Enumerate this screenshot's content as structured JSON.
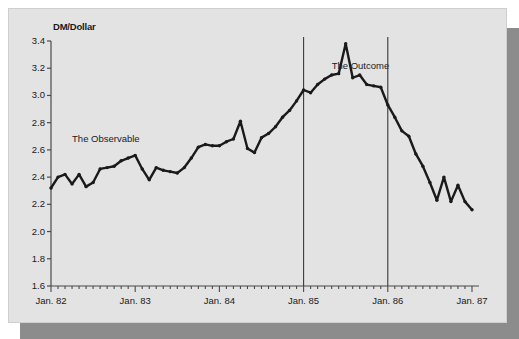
{
  "figure": {
    "background_color": "#e3e3e3",
    "shadow_color": "#8c8c8c",
    "line_color": "#1a1a1a",
    "axis_color": "#4a4a4a"
  },
  "chart_data": {
    "type": "line",
    "title": "",
    "ylabel": "DM/Dollar",
    "xlabel": "",
    "ylim": [
      1.6,
      3.4
    ],
    "yticks": [
      "3.4",
      "3.2",
      "3.0",
      "2.8",
      "2.6",
      "2.4",
      "2.2",
      "2.0",
      "1.8",
      "1.6"
    ],
    "ytick_values": [
      3.4,
      3.2,
      3.0,
      2.8,
      2.6,
      2.4,
      2.2,
      2.0,
      1.8,
      1.6
    ],
    "xticks": [
      "Jan. 82",
      "Jan. 83",
      "Jan. 84",
      "Jan. 85",
      "Jan. 86",
      "Jan. 87"
    ],
    "xtick_values": [
      0,
      12,
      24,
      36,
      48,
      60
    ],
    "xlim": [
      0,
      61
    ],
    "grid": false,
    "legend": "none",
    "minor_tick_interval_months": 1,
    "annotations": [
      {
        "text": "The Observable",
        "x_month": 3,
        "y_value": 2.68
      },
      {
        "text": "The Outcome",
        "x_month": 40,
        "y_value": 3.22
      }
    ],
    "vertical_rules": [
      {
        "x_month": 36,
        "label": "Jan. 85"
      },
      {
        "x_month": 48,
        "label": "Jan. 86"
      }
    ],
    "series": [
      {
        "name": "DM/Dollar exchange rate",
        "x": [
          0,
          1,
          2,
          3,
          4,
          5,
          6,
          7,
          8,
          9,
          10,
          11,
          12,
          13,
          14,
          15,
          16,
          17,
          18,
          19,
          20,
          21,
          22,
          23,
          24,
          25,
          26,
          27,
          28,
          29,
          30,
          31,
          32,
          33,
          34,
          35,
          36,
          37,
          38,
          39,
          40,
          41,
          42,
          43,
          44,
          45,
          46,
          47,
          48,
          49,
          50,
          51,
          52,
          53,
          54,
          55,
          56,
          57,
          58,
          59,
          60
        ],
        "values": [
          2.32,
          2.4,
          2.42,
          2.35,
          2.42,
          2.33,
          2.36,
          2.46,
          2.47,
          2.48,
          2.52,
          2.54,
          2.56,
          2.46,
          2.38,
          2.47,
          2.45,
          2.44,
          2.43,
          2.47,
          2.54,
          2.62,
          2.64,
          2.63,
          2.63,
          2.66,
          2.68,
          2.81,
          2.61,
          2.58,
          2.69,
          2.72,
          2.77,
          2.84,
          2.89,
          2.96,
          3.04,
          3.02,
          3.08,
          3.12,
          3.15,
          3.16,
          3.38,
          3.13,
          3.15,
          3.08,
          3.07,
          3.06,
          2.93,
          2.84,
          2.74,
          2.7,
          2.57,
          2.48,
          2.36,
          2.23,
          2.4,
          2.22,
          2.34,
          2.22,
          2.16
        ]
      }
    ]
  }
}
